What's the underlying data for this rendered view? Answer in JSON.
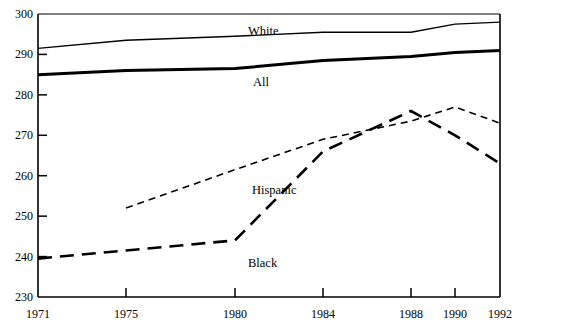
{
  "chart_data": {
    "type": "line",
    "title": "",
    "subtitle": "",
    "xlabel": "",
    "ylabel": "",
    "x": [
      1971,
      1975,
      1980,
      1984,
      1988,
      1990,
      1992
    ],
    "xticklabels": [
      "1971",
      "1975",
      "1980",
      "1984",
      "1988",
      "1990",
      "1992"
    ],
    "yticks": [
      230,
      240,
      250,
      260,
      270,
      280,
      290,
      300
    ],
    "yticklabels": [
      "230",
      "240",
      "250",
      "260",
      "270",
      "280",
      "290",
      "300"
    ],
    "xlim": [
      1971,
      1992
    ],
    "ylim": [
      230,
      300
    ],
    "grid": false,
    "legend_position": "inline-annotations",
    "series": [
      {
        "name": "White",
        "label": "White",
        "style": "solid-thin",
        "color": "#000000",
        "x": [
          1971,
          1975,
          1980,
          1984,
          1988,
          1990,
          1992
        ],
        "values": [
          291.5,
          293.5,
          294.5,
          295.5,
          295.5,
          297.5,
          298.0
        ]
      },
      {
        "name": "All",
        "label": "All",
        "style": "solid-thick",
        "color": "#000000",
        "x": [
          1971,
          1975,
          1980,
          1984,
          1988,
          1990,
          1992
        ],
        "values": [
          285.0,
          286.0,
          286.5,
          288.5,
          289.5,
          290.5,
          291.0
        ]
      },
      {
        "name": "Hispanic",
        "label": "Hispanic",
        "style": "dotted",
        "color": "#000000",
        "x": [
          1975,
          1980,
          1984,
          1988,
          1990,
          1992
        ],
        "values": [
          252.0,
          261.5,
          269.0,
          273.5,
          277.0,
          273.0
        ]
      },
      {
        "name": "Black",
        "label": "Black",
        "style": "dashed",
        "color": "#000000",
        "x": [
          1971,
          1975,
          1980,
          1984,
          1988,
          1990,
          1992
        ],
        "values": [
          239.5,
          241.5,
          244.0,
          266.0,
          276.0,
          270.0,
          263.0
        ]
      }
    ],
    "annotations": [
      {
        "text": "White",
        "series": "White",
        "x_px": 248,
        "y_px": 25
      },
      {
        "text": "All",
        "series": "All",
        "x_px": 253,
        "y_px": 76
      },
      {
        "text": "Hispanic",
        "series": "Hispanic",
        "x_px": 252,
        "y_px": 184
      },
      {
        "text": "Black",
        "series": "Black",
        "x_px": 248,
        "y_px": 257
      }
    ]
  }
}
